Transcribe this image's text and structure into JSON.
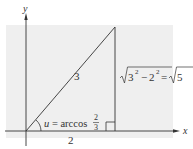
{
  "figure": {
    "background_color": "#efefef",
    "line_color": "#333333",
    "axes": {
      "x_label": "x",
      "y_label": "y"
    },
    "triangle": {
      "hypotenuse_label": "3",
      "base_label": "2",
      "angle_label_prefix": "u = arccos",
      "angle_fraction": {
        "numerator": "2",
        "denominator": "3"
      },
      "opposite_label": {
        "radicand_a": "3",
        "exp_a": "2",
        "minus": "−",
        "radicand_b": "2",
        "exp_b": "2",
        "equals": "=",
        "result_radicand": "5"
      }
    }
  }
}
